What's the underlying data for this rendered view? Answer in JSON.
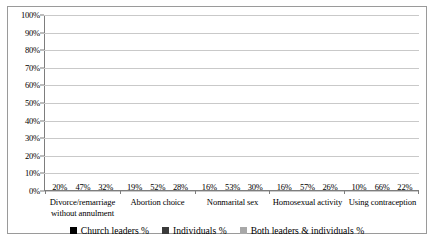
{
  "chart_data": {
    "type": "bar",
    "title": "",
    "xlabel": "",
    "ylabel": "",
    "ylim": [
      0,
      100
    ],
    "grid": true,
    "legend_position": "bottom",
    "categories": [
      "Divorce/remarriage without annulment",
      "Abortion choice",
      "Nonmarital sex",
      "Homosexual activity",
      "Using contraception"
    ],
    "ytick_labels": [
      "100%",
      "90%",
      "80%",
      "70%",
      "60%",
      "50%",
      "40%",
      "30%",
      "20%",
      "10%",
      "0%"
    ],
    "series": [
      {
        "name": "Church leaders %",
        "color": "#000000",
        "values": [
          20,
          19,
          16,
          16,
          10
        ],
        "labels": [
          "20%",
          "19%",
          "16%",
          "16%",
          "10%"
        ]
      },
      {
        "name": "Individuals %",
        "color": "#3a3a3a",
        "values": [
          47,
          52,
          53,
          57,
          66
        ],
        "labels": [
          "47%",
          "52%",
          "53%",
          "57%",
          "66%"
        ]
      },
      {
        "name": "Both leaders & individuals %",
        "color": "#a8a8a8",
        "values": [
          32,
          28,
          30,
          26,
          22
        ],
        "labels": [
          "32%",
          "28%",
          "30%",
          "26%",
          "22%"
        ]
      }
    ]
  }
}
